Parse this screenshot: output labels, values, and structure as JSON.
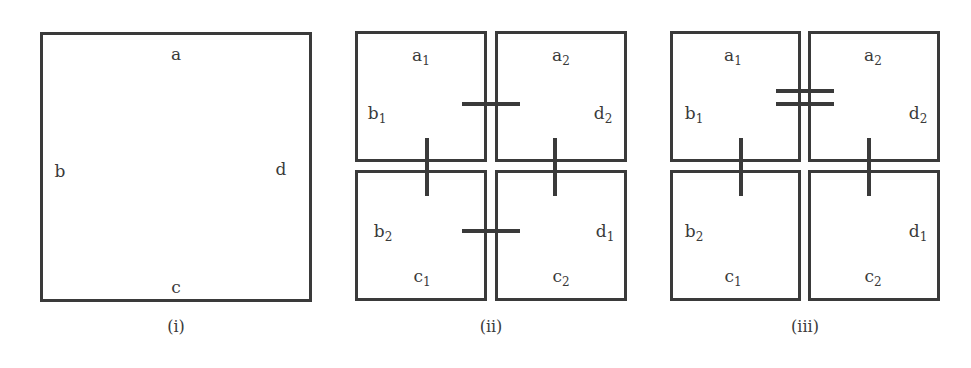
{
  "panels": [
    {
      "caption": "(i)",
      "labels": {
        "a": "a",
        "b": "b",
        "c": "c",
        "d": "d"
      }
    },
    {
      "caption": "(ii)",
      "labels": {
        "tl_top": "a",
        "tl_top_sub": "1",
        "tl_left": "b",
        "tl_left_sub": "1",
        "tr_top": "a",
        "tr_top_sub": "2",
        "tr_right": "d",
        "tr_right_sub": "2",
        "bl_left": "b",
        "bl_left_sub": "2",
        "bl_bottom": "c",
        "bl_bottom_sub": "1",
        "br_right": "d",
        "br_right_sub": "1",
        "br_bottom": "c",
        "br_bottom_sub": "2"
      },
      "markers": [
        "single-tick a1-a2 boundary",
        "single-tick b1-b2 boundary",
        "single-tick d2-d1 boundary",
        "single-tick c1-c2 boundary"
      ]
    },
    {
      "caption": "(iii)",
      "labels": {
        "tl_top": "a",
        "tl_top_sub": "1",
        "tl_left": "b",
        "tl_left_sub": "1",
        "tr_top": "a",
        "tr_top_sub": "2",
        "tr_right": "d",
        "tr_right_sub": "2",
        "bl_left": "b",
        "bl_left_sub": "2",
        "bl_bottom": "c",
        "bl_bottom_sub": "1",
        "br_right": "d",
        "br_right_sub": "1",
        "br_bottom": "c",
        "br_bottom_sub": "2"
      },
      "markers": [
        "double-tick top boundary",
        "single-tick b1-b2 boundary",
        "single-tick d2-d1 boundary"
      ]
    }
  ],
  "colors": {
    "stroke": "#3a3a3a",
    "background": "#ffffff"
  }
}
